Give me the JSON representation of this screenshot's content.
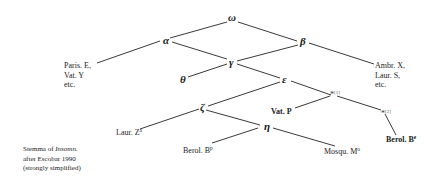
{
  "diagram": {
    "type": "stemma",
    "nodes": {
      "omega": "ω",
      "alpha": "α",
      "beta": "β",
      "gamma": "γ",
      "theta": "θ",
      "epsilon": "ε",
      "zeta": "ζ",
      "eta": "η",
      "star1": "*",
      "star1_note": "[1]",
      "star2": "*",
      "star2_note": "[2]"
    },
    "manuscripts": {
      "paris_line1": "Paris. E,",
      "paris_line2": "Vat. Y",
      "paris_line3": "etc.",
      "ambr_line1": "Ambr. X,",
      "ambr_line2": "Laur. S,",
      "ambr_line3": "etc.",
      "vat_p": "Vat. P",
      "laur_z": "Laur. Z",
      "laur_z_sup": "a",
      "berol_bp": "Berol. B",
      "berol_bp_sup": "p",
      "mosqu": "Mosqu. M",
      "mosqu_sup": "o",
      "berol_be": "Berol. B",
      "berol_be_sup": "e"
    },
    "edges": [
      [
        "ω",
        "α"
      ],
      [
        "ω",
        "β"
      ],
      [
        "α",
        "Paris. E, Vat. Y etc."
      ],
      [
        "α",
        "γ"
      ],
      [
        "β",
        "γ"
      ],
      [
        "β",
        "Ambr. X, Laur. S, etc."
      ],
      [
        "γ",
        "θ"
      ],
      [
        "γ",
        "ε"
      ],
      [
        "ε",
        "ζ"
      ],
      [
        "ε",
        "*[1]"
      ],
      [
        "ζ",
        "Laur. Z^a"
      ],
      [
        "ζ",
        "η"
      ],
      [
        "η",
        "Berol. B^p"
      ],
      [
        "η",
        "Mosqu. M^o"
      ],
      [
        "*[1]",
        "Vat. P"
      ],
      [
        "*[1]",
        "*[2]"
      ],
      [
        "*[2]",
        "Berol. B^e"
      ]
    ],
    "caption": {
      "line1_prefix": "Stemma of ",
      "line1_title": "Insomn.",
      "line2": "after Escobar 1990",
      "line3": "(strongly simplified)"
    }
  }
}
